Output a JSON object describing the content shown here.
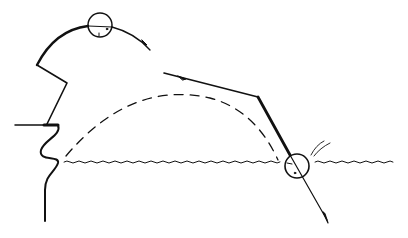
{
  "figure": {
    "width": 408,
    "height": 238,
    "background": "#ffffff",
    "stroke_color": "#111111",
    "labels": []
  },
  "elements": {
    "upper_arc": {
      "description": "curved arc path with arrowhead"
    },
    "top_circle": {
      "cx": 100,
      "cy": 25,
      "r": 12
    },
    "left_boundary": {
      "description": "zigzag wall with horizontal ledge and wavy lower edge"
    },
    "dashed_trajectory": {
      "description": "dashed parabolic path from ledge to water entry"
    },
    "straight_path": {
      "description": "bent line descending into water with arrowhead"
    },
    "water_circle": {
      "cx": 297,
      "cy": 166,
      "r": 12
    },
    "water_surface": {
      "y": 162
    },
    "splash": {
      "description": "small curved splash marks"
    }
  }
}
